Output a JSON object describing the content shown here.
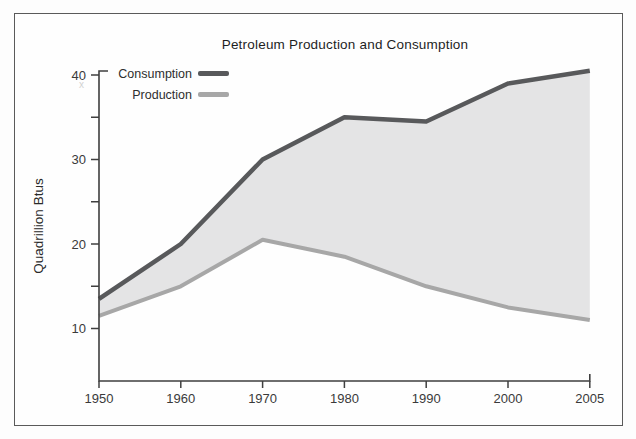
{
  "figure": {
    "title": "Petroleum Production and Consumption",
    "artifact_mark": "x"
  },
  "chart_data": {
    "type": "area",
    "title": "Petroleum Production and Consumption",
    "xlabel": "",
    "ylabel": "Quadrillion Btus",
    "categories": [
      "1950",
      "1960",
      "1970",
      "1980",
      "1990",
      "2000",
      "2005"
    ],
    "series": [
      {
        "name": "Consumption",
        "values": [
          13.5,
          20,
          30,
          35,
          34.5,
          39,
          40.5
        ],
        "color": "#58595b"
      },
      {
        "name": "Production",
        "values": [
          11.5,
          15,
          20.5,
          18.5,
          15,
          12.5,
          11
        ],
        "color": "#a7a7a7"
      }
    ],
    "fill_between_color": "#e4e4e5",
    "y_ticks_labeled": [
      10,
      20,
      30,
      40
    ],
    "y_ticks_minor": [
      15,
      25,
      35
    ],
    "ylim": [
      4,
      42
    ],
    "grid": false,
    "legend_position": "top-left",
    "axis_color": "#3f3f3f",
    "tick_label_color": "#3a3a3a"
  }
}
